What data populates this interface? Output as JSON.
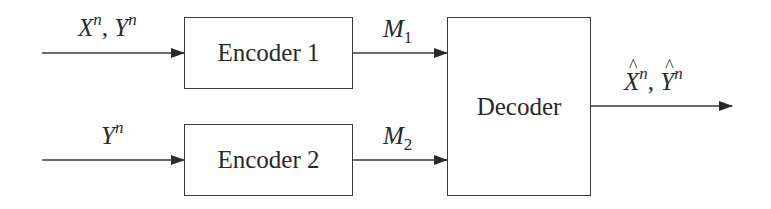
{
  "diagram": {
    "type": "block-diagram",
    "blocks": [
      {
        "id": "encoder1",
        "label": "Encoder 1"
      },
      {
        "id": "encoder2",
        "label": "Encoder 2"
      },
      {
        "id": "decoder",
        "label": "Decoder"
      }
    ],
    "inputs": {
      "encoder1": {
        "base1": "X",
        "sup1": "n",
        "sep": ", ",
        "base2": "Y",
        "sup2": "n"
      },
      "encoder2": {
        "base": "Y",
        "sup": "n"
      }
    },
    "messages": {
      "m1": {
        "base": "M",
        "sub": "1"
      },
      "m2": {
        "base": "M",
        "sub": "2"
      }
    },
    "output": {
      "base1": "X",
      "sup1": "n",
      "sep": ", ",
      "base2": "Y",
      "sup2": "n",
      "hat": true
    },
    "edges": [
      {
        "from": "input-1",
        "to": "encoder1",
        "label": "X^n, Y^n"
      },
      {
        "from": "input-2",
        "to": "encoder2",
        "label": "Y^n"
      },
      {
        "from": "encoder1",
        "to": "decoder",
        "label": "M_1"
      },
      {
        "from": "encoder2",
        "to": "decoder",
        "label": "M_2"
      },
      {
        "from": "decoder",
        "to": "output",
        "label": "X̂^n, Ŷ^n"
      }
    ]
  }
}
